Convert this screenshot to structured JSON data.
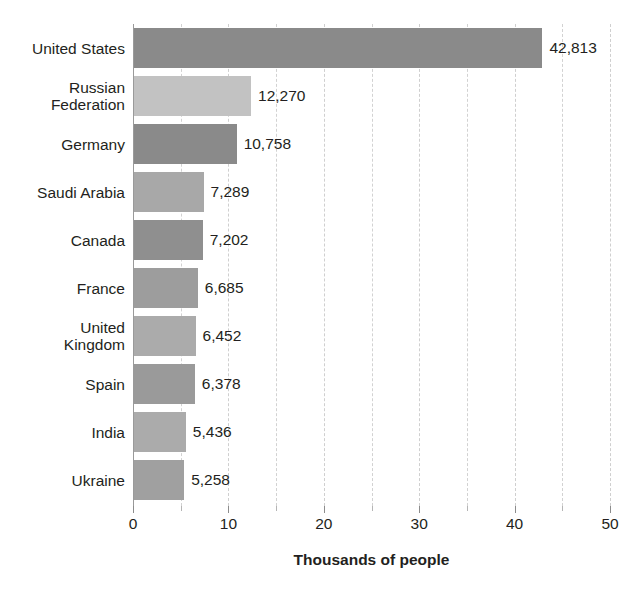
{
  "chart_data": {
    "type": "bar",
    "orientation": "horizontal",
    "title": "",
    "subtitle": "",
    "xlabel": "Thousands of people",
    "ylabel": "",
    "xlim": [
      0,
      50
    ],
    "xticks": [
      0,
      10,
      20,
      30,
      40,
      50
    ],
    "xtick_labels": [
      "0",
      "10",
      "20",
      "30",
      "40",
      "50"
    ],
    "minor_tick_interval": 5,
    "grid": true,
    "grid_axis": "x",
    "grid_style": "dashed",
    "legend": false,
    "value_label_format": "comma-separated integer",
    "units_note": "bar lengths are in thousands; data labels show counts of people",
    "categories": [
      "United States",
      "Russian Federation",
      "Germany",
      "Saudi Arabia",
      "Canada",
      "France",
      "United Kingdom",
      "Spain",
      "India",
      "Ukraine"
    ],
    "category_label_lines": [
      [
        "United States"
      ],
      [
        "Russian",
        "Federation"
      ],
      [
        "Germany"
      ],
      [
        "Saudi Arabia"
      ],
      [
        "Canada"
      ],
      [
        "France"
      ],
      [
        "United",
        "Kingdom"
      ],
      [
        "Spain"
      ],
      [
        "India"
      ],
      [
        "Ukraine"
      ]
    ],
    "values": [
      42813,
      12270,
      10758,
      7289,
      7202,
      6685,
      6452,
      6378,
      5436,
      5258
    ],
    "value_labels": [
      "42,813",
      "12,270",
      "10,758",
      "7,289",
      "7,202",
      "6,685",
      "6,452",
      "6,378",
      "5,436",
      "5,258"
    ],
    "bar_scaled_values": [
      42.813,
      12.27,
      10.758,
      7.289,
      7.202,
      6.685,
      6.452,
      6.378,
      5.436,
      5.258
    ],
    "bar_colors": [
      "#8a8a8a",
      "#c2c2c2",
      "#8a8a8a",
      "#a8a8a8",
      "#8f8f8f",
      "#9d9d9d",
      "#ababab",
      "#9a9a9a",
      "#ababab",
      "#a0a0a0"
    ]
  },
  "colors": {
    "background": "#ffffff",
    "text": "#231f20",
    "axis": "#9a9a9a",
    "gridline": "#d2d2d2",
    "bar_dark": "#8a8a8a",
    "bar_light": "#c2c2c2"
  }
}
